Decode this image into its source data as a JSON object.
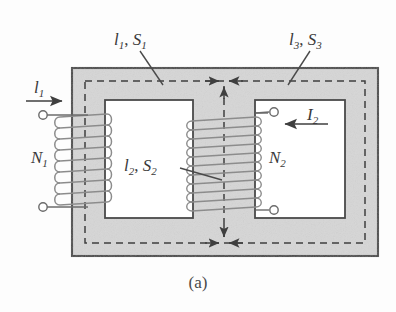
{
  "figure": {
    "caption": "(a)",
    "colors": {
      "core_fill": "#d6d6d6",
      "core_stroke": "#4a4a4a",
      "window_fill": "#ffffff",
      "dashed_flux": "#3f3f3f",
      "winding": "#8c8c8c",
      "lead": "#6b6b6b",
      "text": "#3a3a3a",
      "background": "#fdfdfd"
    }
  },
  "labels": {
    "top_left": {
      "symbol": "l",
      "sub": "1",
      "symbol2": "S",
      "sub2": "1",
      "text": "l1, S1"
    },
    "top_right": {
      "symbol": "l",
      "sub": "3",
      "symbol2": "S",
      "sub2": "3",
      "text": "l3, S3"
    },
    "center": {
      "symbol": "l",
      "sub": "2",
      "symbol2": "S",
      "sub2": "2",
      "text": "l2, S2"
    },
    "current_left": {
      "symbol": "l",
      "sub": "1",
      "text": "l1"
    },
    "current_right": {
      "symbol": "I",
      "sub": "2",
      "text": "I2"
    },
    "turns_left": {
      "symbol": "N",
      "sub": "1",
      "text": "N1"
    },
    "turns_right": {
      "symbol": "N",
      "sub": "2",
      "text": "N2"
    }
  },
  "geometry": {
    "core_outer": {
      "x": 72,
      "y": 68,
      "w": 306,
      "h": 188
    },
    "window_left": {
      "x": 105,
      "y": 100,
      "w": 88,
      "h": 118
    },
    "window_right": {
      "x": 255,
      "y": 100,
      "w": 90,
      "h": 118
    },
    "flux_path": {
      "x": 85,
      "y": 81,
      "w": 280,
      "h": 162
    },
    "center_limb": {
      "x": 193,
      "y": 100,
      "w": 62,
      "h": 118
    },
    "winding_left_turns": 9,
    "winding_center_turns": 12
  }
}
